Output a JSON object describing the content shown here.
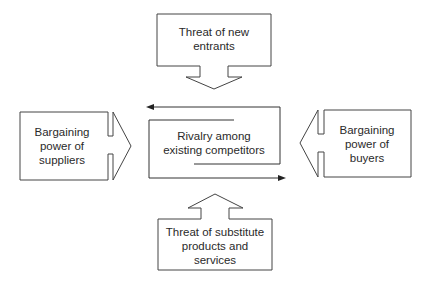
{
  "diagram": {
    "nodes": {
      "top": {
        "lines": [
          "Threat of new",
          "entrants"
        ]
      },
      "left": {
        "lines": [
          "Bargaining",
          "power of",
          "suppliers"
        ]
      },
      "center": {
        "lines": [
          "Rivalry among",
          "existing competitors"
        ]
      },
      "right": {
        "lines": [
          "Bargaining",
          "power of",
          "buyers"
        ]
      },
      "bottom": {
        "lines": [
          "Threat of substitute",
          "products and",
          "services"
        ]
      }
    },
    "edges": [
      {
        "from": "top",
        "to": "center",
        "direction": "down"
      },
      {
        "from": "left",
        "to": "center",
        "direction": "right"
      },
      {
        "from": "right",
        "to": "center",
        "direction": "left"
      },
      {
        "from": "bottom",
        "to": "center",
        "direction": "up"
      }
    ],
    "colors": {
      "stroke": "#444444",
      "text": "#2a2a2a",
      "background": "#ffffff"
    }
  }
}
